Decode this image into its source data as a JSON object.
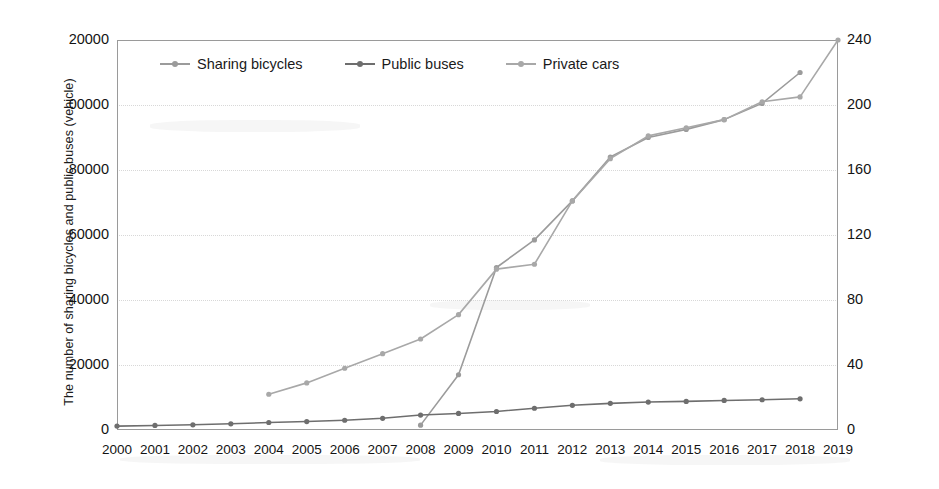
{
  "chart_data": {
    "type": "line",
    "title": "",
    "xlabel": "",
    "ylabel": "The number of sharing bicycles and public buses (vehicle)",
    "y2label": "The number of private cars (10k vehicle)",
    "grid": true,
    "legend_position": "top-left-inside",
    "x": [
      "2000",
      "2001",
      "2002",
      "2003",
      "2004",
      "2005",
      "2006",
      "2007",
      "2008",
      "2009",
      "2010",
      "2011",
      "2012",
      "2013",
      "2014",
      "2015",
      "2016",
      "2017",
      "2018",
      "2019"
    ],
    "categories": [
      "2000",
      "2001",
      "2002",
      "2003",
      "2004",
      "2005",
      "2006",
      "2007",
      "2008",
      "2009",
      "2010",
      "2011",
      "2012",
      "2013",
      "2014",
      "2015",
      "2016",
      "2017",
      "2018",
      "2019"
    ],
    "ylim": [
      0,
      120000
    ],
    "yticks": [
      0,
      20000,
      40000,
      60000,
      80000,
      100000,
      120000
    ],
    "ytick_labels": [
      "0",
      "20000",
      "40000",
      "60000",
      "80000",
      "00000",
      "20000"
    ],
    "y2lim": [
      0,
      240
    ],
    "y2ticks": [
      0,
      40,
      80,
      120,
      160,
      200,
      240
    ],
    "y2tick_labels": [
      "0",
      "40",
      "80",
      "120",
      "160",
      "200",
      "240"
    ],
    "series": [
      {
        "name": "Sharing bicycles",
        "axis": "left",
        "color": "#9b9b9b",
        "values": [
          null,
          null,
          null,
          null,
          null,
          null,
          null,
          null,
          1500,
          17000,
          50000,
          58500,
          70500,
          84000,
          90000,
          92500,
          95500,
          100500,
          110000,
          null
        ]
      },
      {
        "name": "Public buses",
        "axis": "left",
        "color": "#6e6e6e",
        "values": [
          1200,
          1400,
          1600,
          1900,
          2300,
          2600,
          3000,
          3600,
          4600,
          5100,
          5700,
          6700,
          7600,
          8200,
          8600,
          8800,
          9100,
          9300,
          9600,
          null
        ]
      },
      {
        "name": "Private cars",
        "axis": "right",
        "color": "#a8a8a8",
        "values": [
          null,
          null,
          null,
          null,
          22,
          29,
          38,
          47,
          56,
          71,
          99,
          102,
          141,
          167,
          181,
          186,
          191,
          202,
          205,
          240
        ]
      }
    ]
  },
  "legend": {
    "items": [
      {
        "label": "Sharing bicycles",
        "color": "#9b9b9b"
      },
      {
        "label": "Public buses",
        "color": "#6e6e6e"
      },
      {
        "label": "Private cars",
        "color": "#a8a8a8"
      }
    ]
  },
  "axes": {
    "left_title": "The number of sharing bicycles and public buses (vehicle)",
    "right_title": "The number of private cars (10k vehicle)"
  }
}
